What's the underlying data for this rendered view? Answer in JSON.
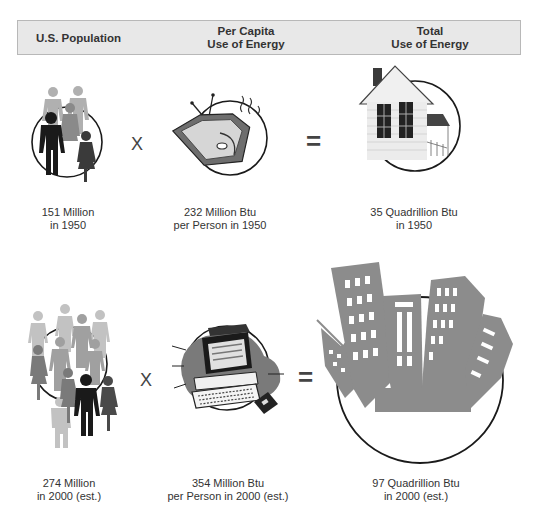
{
  "header": {
    "col1": "U.S. Population",
    "col2_line1": "Per Capita",
    "col2_line2": "Use of Energy",
    "col3_line1": "Total",
    "col3_line2": "Use of Energy"
  },
  "rows": [
    {
      "year": "1950",
      "population_line1": "151 Million",
      "population_line2": "in 1950",
      "per_capita_line1": "232 Million Btu",
      "per_capita_line2": "per Person in 1950",
      "total_line1": "35 Quadrillion Btu",
      "total_line2": "in 1950",
      "multiply": "X",
      "equals": "="
    },
    {
      "year": "2000 (est.)",
      "population_line1": "274 Million",
      "population_line2": "in 2000 (est.)",
      "per_capita_line1": "354 Million Btu",
      "per_capita_line2": "per Person in 2000 (est.)",
      "total_line1": "97 Quadrillion Btu",
      "total_line2": "in 2000 (est.)",
      "multiply": "X",
      "equals": "="
    }
  ],
  "icons": {
    "row1": [
      "people-group-icon",
      "television-icon",
      "house-icon"
    ],
    "row2": [
      "large-crowd-icon",
      "computer-icon",
      "city-skyline-icon"
    ]
  },
  "colors": {
    "header_bg": "#e8e8e8",
    "header_border": "#b8b8b8",
    "dark_figure": "#1a1a1a",
    "mid_gray": "#7a7a7a",
    "light_gray": "#b0b0b0",
    "building_gray": "#8c8c8c"
  }
}
